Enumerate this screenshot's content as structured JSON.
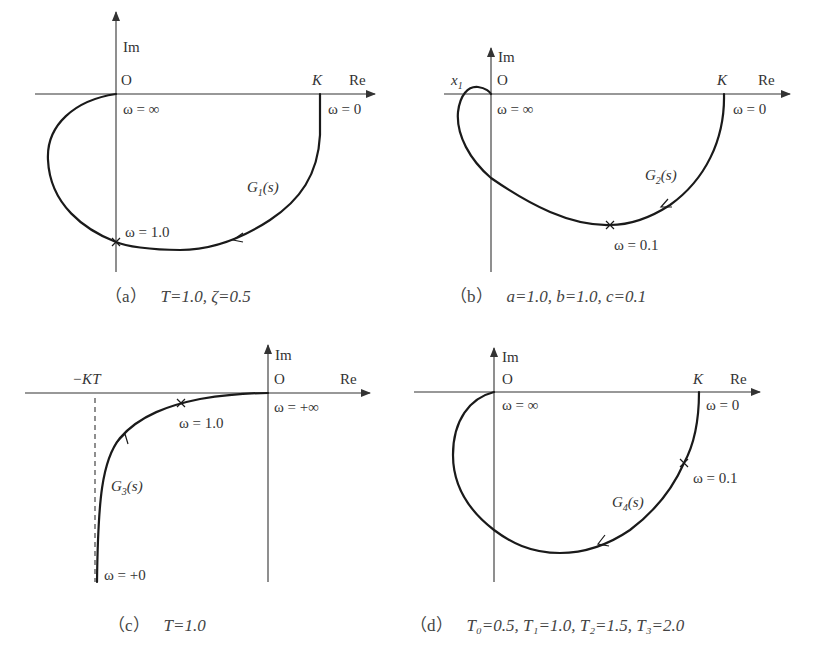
{
  "figure": {
    "type": "nyquist-diagrams",
    "panels": [
      {
        "id": "a",
        "axes": {
          "im": "Im",
          "re": "Re",
          "origin": "O"
        },
        "point_labels": {
          "k": "K",
          "w_inf": "ω = ∞",
          "w_zero": "ω = 0",
          "marker": "ω = 1.0"
        },
        "curve_label": {
          "name": "G",
          "sub": "1",
          "arg": "(s)"
        },
        "caption": {
          "tag": "（a）",
          "params": "T=1.0,  ζ=0.5"
        }
      },
      {
        "id": "b",
        "axes": {
          "im": "Im",
          "re": "Re",
          "origin": "O"
        },
        "point_labels": {
          "k": "K",
          "x1": "x",
          "x1_sub": "1",
          "w_inf": "ω = ∞",
          "w_zero": "ω = 0",
          "marker": "ω = 0.1"
        },
        "curve_label": {
          "name": "G",
          "sub": "2",
          "arg": "(s)"
        },
        "caption": {
          "tag": "（b）",
          "params": "a=1.0,  b=1.0,  c=0.1"
        }
      },
      {
        "id": "c",
        "axes": {
          "im": "Im",
          "re": "Re",
          "origin": "O"
        },
        "point_labels": {
          "kt": "−KT",
          "w_inf": "ω = +∞",
          "w_zero": "ω = +0",
          "marker": "ω = 1.0"
        },
        "curve_label": {
          "name": "G",
          "sub": "3",
          "arg": "(s)"
        },
        "caption": {
          "tag": "（c）",
          "params": "T=1.0"
        }
      },
      {
        "id": "d",
        "axes": {
          "im": "Im",
          "re": "Re",
          "origin": "O"
        },
        "point_labels": {
          "k": "K",
          "w_inf": "ω = ∞",
          "w_zero": "ω = 0",
          "marker": "ω = 0.1"
        },
        "curve_label": {
          "name": "G",
          "sub": "4",
          "arg": "(s)"
        },
        "caption": {
          "tag": "（d）",
          "params": "T₀=0.5,  T₁=1.0,  T₂=1.5,  T₃=2.0"
        }
      }
    ],
    "colors": {
      "line": "#1a1a1a",
      "text": "#333333",
      "background": "#ffffff"
    }
  }
}
